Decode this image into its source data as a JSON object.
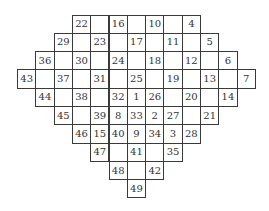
{
  "figure": {
    "rows": [
      {
        "start_col": 3,
        "cells": [
          "22",
          "",
          "16",
          "",
          "10",
          "",
          "4"
        ]
      },
      {
        "start_col": 2,
        "cells": [
          "29",
          "",
          "23",
          "",
          "17",
          "",
          "11",
          "",
          "5"
        ]
      },
      {
        "start_col": 1,
        "cells": [
          "36",
          "",
          "30",
          "",
          "24",
          "",
          "18",
          "",
          "12",
          "",
          "6"
        ]
      },
      {
        "start_col": 0,
        "cells": [
          "43",
          "",
          "37",
          "",
          "31",
          "",
          "25",
          "",
          "19",
          "",
          "13",
          "",
          "7"
        ]
      },
      {
        "start_col": 1,
        "cells": [
          "44",
          "",
          "38",
          "",
          "32",
          "1",
          "26",
          "",
          "20",
          "",
          "14"
        ]
      },
      {
        "start_col": 2,
        "cells": [
          "45",
          "",
          "39",
          "8",
          "33",
          "2",
          "27",
          "",
          "21"
        ]
      },
      {
        "start_col": 3,
        "cells": [
          "46",
          "15",
          "40",
          "9",
          "34",
          "3",
          "28"
        ]
      },
      {
        "start_col": 4,
        "cells": [
          "47",
          "",
          "41",
          "",
          "35"
        ]
      },
      {
        "start_col": 5,
        "cells": [
          "48",
          "",
          "42"
        ]
      },
      {
        "start_col": 6,
        "cells": [
          "49"
        ]
      }
    ],
    "colors": {
      "border": "#3a3a3a",
      "text": "#333333",
      "background": "#ffffff"
    }
  }
}
